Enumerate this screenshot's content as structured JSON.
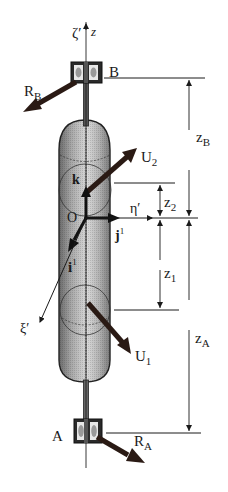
{
  "diagram": {
    "type": "rotor-on-bearings free body diagram",
    "axis_labels": {
      "zeta_prime": "ζ′",
      "z": "z",
      "eta_prime": "η′",
      "xi_prime": "ξ′"
    },
    "points": {
      "B": "B",
      "A": "A",
      "O": "O"
    },
    "unit_vectors": {
      "k": "k",
      "j": "j",
      "i": "i",
      "superscript": "1"
    },
    "forces": {
      "RB": {
        "main": "R",
        "sub": "B"
      },
      "RA": {
        "main": "R",
        "sub": "A"
      },
      "U1": {
        "main": "U",
        "sub": "1"
      },
      "U2": {
        "main": "U",
        "sub": "2"
      }
    },
    "dimensions": {
      "zB": {
        "main": "z",
        "sub": "B"
      },
      "zA": {
        "main": "z",
        "sub": "A"
      },
      "z1": {
        "main": "z",
        "sub": "1"
      },
      "z2": {
        "main": "z",
        "sub": "2"
      }
    },
    "colors": {
      "ink": "#1a1a1a",
      "force_arrow": "#2a1a14",
      "cylinder_dark": "#6e6e6e",
      "cylinder_light": "#d6d6d6"
    }
  }
}
